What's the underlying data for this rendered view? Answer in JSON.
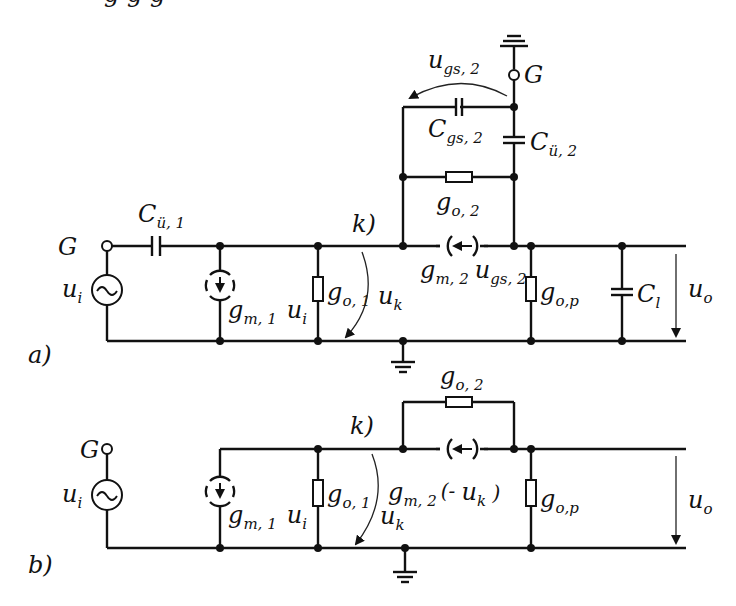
{
  "top_cut_text": "g g g",
  "panel_a": {
    "label": "a)",
    "source_terminal": "G",
    "source_voltage": {
      "main": "u",
      "sub": "i"
    },
    "coupling_cap_1": {
      "main": "C",
      "sub": "ü, 1"
    },
    "current_source_1": {
      "main": "g",
      "sub": "m, 1",
      "tail_main": "u",
      "tail_sub": "i"
    },
    "conductance_1": {
      "main": "g",
      "sub": "o, 1"
    },
    "node_label": "k)",
    "node_voltage": {
      "main": "u",
      "sub": "k"
    },
    "gate_terminal": "G",
    "gate_voltage": {
      "main": "u",
      "sub": "gs, 2"
    },
    "gate_cap": {
      "main": "C",
      "sub": "gs, 2"
    },
    "coupling_cap_2": {
      "main": "C",
      "sub": "ü, 2"
    },
    "conductance_2": {
      "main": "g",
      "sub": "o, 2"
    },
    "current_source_2": {
      "main": "g",
      "sub": "m, 2",
      "tail_main": "u",
      "tail_sub": "gs, 2"
    },
    "conductance_p": {
      "main": "g",
      "sub": "o,p"
    },
    "load_cap": {
      "main": "C",
      "sub": "l"
    },
    "output_voltage": {
      "main": "u",
      "sub": "o"
    }
  },
  "panel_b": {
    "label": "b)",
    "source_terminal": "G",
    "source_voltage": {
      "main": "u",
      "sub": "i"
    },
    "current_source_1": {
      "main": "g",
      "sub": "m, 1",
      "tail_main": "u",
      "tail_sub": "i"
    },
    "conductance_1": {
      "main": "g",
      "sub": "o, 1"
    },
    "node_label": "k)",
    "node_voltage": {
      "main": "u",
      "sub": "k"
    },
    "conductance_2": {
      "main": "g",
      "sub": "o, 2"
    },
    "current_source_2": {
      "main": "g",
      "sub": "m, 2",
      "tail_pre": "(- ",
      "tail_main": "u",
      "tail_sub": "k",
      "tail_post": " )"
    },
    "conductance_p": {
      "main": "g",
      "sub": "o,p"
    },
    "output_voltage": {
      "main": "u",
      "sub": "o"
    }
  }
}
